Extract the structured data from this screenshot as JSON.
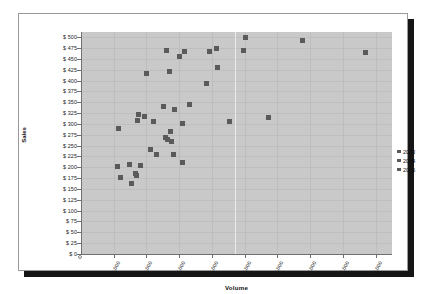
{
  "chart_data": {
    "type": "scatter",
    "title": "",
    "xlabel": "Volume",
    "ylabel": "Sales",
    "xlim": [
      0,
      95000
    ],
    "ylim": [
      0,
      512
    ],
    "grid": true,
    "legend_position": "right",
    "x_ticks": [
      "10,000",
      "20,000",
      "30,000",
      "40,000",
      "50,000",
      "60,000",
      "70,000",
      "80,000",
      "90,000"
    ],
    "x_tick_values": [
      10000,
      20000,
      30000,
      40000,
      50000,
      60000,
      70000,
      80000,
      90000
    ],
    "y_ticks": [
      "$ 0",
      "$ 25",
      "$ 50",
      "$ 75",
      "$ 100",
      "$ 125",
      "$ 150",
      "$ 175",
      "$ 200",
      "$ 225",
      "$ 250",
      "$ 275",
      "$ 300",
      "$ 325",
      "$ 350",
      "$ 375",
      "$ 400",
      "$ 425",
      "$ 450",
      "$ 475",
      "$ 500"
    ],
    "y_tick_values": [
      0,
      25,
      50,
      75,
      100,
      125,
      150,
      175,
      200,
      225,
      250,
      275,
      300,
      325,
      350,
      375,
      400,
      425,
      450,
      475,
      500
    ],
    "series": [
      {
        "name": "2003",
        "color": "#5a5a5a",
        "points": [
          [
            11500,
            290
          ],
          [
            11000,
            201
          ],
          [
            12200,
            176
          ],
          [
            14800,
            206
          ],
          [
            15300,
            162
          ],
          [
            16700,
            186
          ],
          [
            16900,
            181
          ],
          [
            17300,
            307
          ],
          [
            17600,
            321
          ],
          [
            18100,
            203
          ],
          [
            19300,
            318
          ],
          [
            20000,
            417
          ],
          [
            21300,
            241
          ],
          [
            22200,
            306
          ],
          [
            23100,
            229
          ],
          [
            25100,
            341
          ],
          [
            25900,
            268
          ],
          [
            26400,
            264
          ],
          [
            27100,
            420
          ],
          [
            27300,
            283
          ],
          [
            27600,
            259
          ],
          [
            28200,
            230
          ],
          [
            28500,
            333
          ],
          [
            26000,
            470
          ],
          [
            30200,
            456
          ],
          [
            30900,
            300
          ],
          [
            31000,
            211
          ],
          [
            31600,
            468
          ],
          [
            33000,
            344
          ],
          [
            38300,
            394
          ],
          [
            39100,
            466
          ],
          [
            41400,
            474
          ],
          [
            41600,
            430
          ],
          [
            45400,
            305
          ],
          [
            49500,
            469
          ],
          [
            50400,
            499
          ],
          [
            57300,
            314
          ],
          [
            67700,
            492
          ],
          [
            86800,
            464
          ]
        ]
      },
      {
        "name": "2004",
        "color": "#5a5a5a",
        "points": []
      },
      {
        "name": "2005",
        "color": "#5a5a5a",
        "points": []
      }
    ]
  },
  "legend": {
    "items": [
      {
        "label": "2003",
        "color": "#5a5a5a"
      },
      {
        "label": "2004",
        "color": "#5a5a5a"
      },
      {
        "label": "2005",
        "color": "#5a5a5a"
      }
    ]
  },
  "style": {
    "plot_background": "#c9c9c9",
    "page_background": "#ffffff",
    "marker_color": "#5a5a5a",
    "axis_color": "#6f6f6f",
    "frame_border": "#9a9a9a",
    "shadow": "#151515"
  }
}
